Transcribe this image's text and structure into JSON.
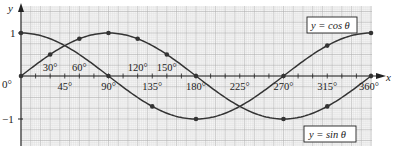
{
  "chart_data": {
    "type": "line",
    "title": "",
    "xlabel": "x",
    "ylabel": "y",
    "xlim": [
      0,
      360
    ],
    "ylim": [
      -1,
      1
    ],
    "grid": true,
    "x_tick_labels_above": [
      "30°",
      "60°",
      "120°",
      "150°"
    ],
    "x_tick_labels_below": [
      "45°",
      "90°",
      "135°",
      "180°",
      "225°",
      "270°",
      "315°",
      "360°"
    ],
    "origin_label": "0°",
    "y_tick_labels": [
      "1",
      "−1"
    ],
    "series": [
      {
        "name": "y = sin θ",
        "x": [
          0,
          30,
          60,
          90,
          120,
          150,
          180,
          225,
          270,
          315,
          360
        ],
        "values": [
          0,
          0.5,
          0.87,
          1,
          0.87,
          0.5,
          0,
          -0.71,
          -1,
          -0.71,
          0
        ],
        "marked_x": [
          0,
          30,
          60,
          90,
          120,
          150,
          180,
          270,
          315,
          360
        ]
      },
      {
        "name": "y = cos θ",
        "x": [
          0,
          45,
          90,
          135,
          180,
          225,
          270,
          315,
          360
        ],
        "values": [
          1,
          0.71,
          0,
          -0.71,
          -1,
          -0.71,
          0,
          0.71,
          1
        ],
        "marked_x": [
          0,
          90,
          135,
          180,
          270,
          315,
          360
        ]
      }
    ],
    "annotations": [
      "y = cos θ",
      "y = sin θ"
    ],
    "legend_position": "inline boxed labels (cos top-right, sin bottom-right)"
  },
  "labels": {
    "y_axis": "y",
    "x_axis": "x",
    "cos_box": "y = cos θ",
    "sin_box": "y = sin θ",
    "y_one": "1",
    "y_minus_one": "−1",
    "origin": "0°"
  },
  "colors": {
    "grid_minor": "#d6d6d6",
    "grid_major": "#b0b0b0",
    "curve": "#333333",
    "axis": "#222222"
  }
}
